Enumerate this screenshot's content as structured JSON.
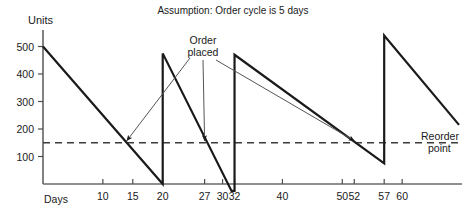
{
  "chart_data": {
    "type": "line",
    "title": "Assumption: Order cycle is 5 days",
    "xlabel": "Days",
    "ylabel": "Units",
    "xlim": [
      0,
      70
    ],
    "ylim": [
      0,
      560
    ],
    "grid": false,
    "legend": "none",
    "x_ticks": [
      10,
      15,
      20,
      27,
      30,
      32,
      40,
      50,
      52,
      57,
      60
    ],
    "x_tick_labels": [
      "10",
      "15",
      "20",
      "27",
      "30",
      "32",
      "40",
      "50",
      "52",
      "57",
      "60"
    ],
    "y_ticks": [
      100,
      200,
      300,
      400,
      500
    ],
    "y_tick_labels": [
      "100",
      "200",
      "300",
      "400",
      "500"
    ],
    "series": [
      {
        "name": "Inventory level",
        "points": [
          {
            "x": 0,
            "y": 500
          },
          {
            "x": 20,
            "y": 0
          },
          {
            "x": 20,
            "y": 475
          },
          {
            "x": 31.5,
            "y": -25
          },
          {
            "x": 32,
            "y": -25
          },
          {
            "x": 32,
            "y": 470
          },
          {
            "x": 57,
            "y": 75
          },
          {
            "x": 57,
            "y": 540
          },
          {
            "x": 69.5,
            "y": 215
          }
        ]
      }
    ],
    "reorder_line": {
      "label_line1": "Reorder",
      "label_line2": "point",
      "value": 150,
      "style": "dashed"
    },
    "annotations": [
      {
        "label_line1": "Order",
        "label_line2": "placed",
        "arrow_targets": [
          {
            "x": 14,
            "y": 150
          },
          {
            "x": 27,
            "y": 150
          },
          {
            "x": 52,
            "y": 150
          }
        ]
      }
    ],
    "colors": {
      "line": "#1a1a1a",
      "axis": "#4d4d4d",
      "reorder_dash": "#3b3b3b",
      "arrow": "#555555",
      "background": "#ffffff"
    }
  }
}
